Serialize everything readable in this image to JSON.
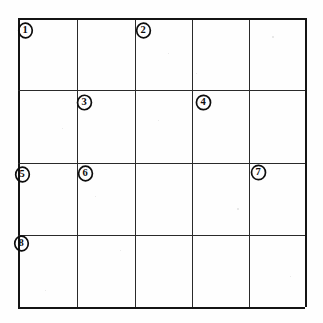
{
  "document": {
    "kind": "hand-drawn-grid-worksheet",
    "background_color": "#fefefe",
    "ink_color": "#141414"
  },
  "grid": {
    "columns": 5,
    "rows": 4,
    "left": 18,
    "top": 18,
    "right": 305,
    "bottom": 307,
    "x_lines": [
      18,
      77,
      135,
      192,
      249,
      305
    ],
    "y_lines": [
      18,
      90,
      163,
      235,
      307
    ]
  },
  "markers": [
    {
      "label": "1",
      "icon": "circled-number-icon",
      "x": 25,
      "y": 30
    },
    {
      "label": "2",
      "icon": "circled-number-icon",
      "x": 143,
      "y": 30
    },
    {
      "label": "3",
      "icon": "circled-number-icon",
      "x": 84,
      "y": 102
    },
    {
      "label": "4",
      "icon": "circled-number-icon",
      "x": 203,
      "y": 102
    },
    {
      "label": "5",
      "icon": "circled-number-icon",
      "x": 22,
      "y": 174
    },
    {
      "label": "6",
      "icon": "circled-number-icon",
      "x": 85,
      "y": 173
    },
    {
      "label": "7",
      "icon": "circled-number-icon",
      "x": 258,
      "y": 172
    },
    {
      "label": "8",
      "icon": "circled-number-icon",
      "x": 21,
      "y": 243
    }
  ],
  "specks": [
    {
      "x": 272,
      "y": 36,
      "size": 1.6
    },
    {
      "x": 196,
      "y": 73,
      "size": 1.3
    },
    {
      "x": 62,
      "y": 128,
      "size": 1.4
    },
    {
      "x": 158,
      "y": 120,
      "size": 1.2
    },
    {
      "x": 237,
      "y": 208,
      "size": 1.5
    },
    {
      "x": 120,
      "y": 250,
      "size": 1.3
    },
    {
      "x": 290,
      "y": 276,
      "size": 1.4
    },
    {
      "x": 45,
      "y": 290,
      "size": 1.2
    },
    {
      "x": 168,
      "y": 53,
      "size": 1.1
    },
    {
      "x": 95,
      "y": 196,
      "size": 1.2
    }
  ]
}
